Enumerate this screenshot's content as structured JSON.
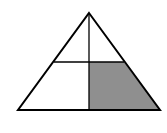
{
  "diagram": {
    "type": "geometric-figure",
    "shape": "triangle",
    "width": 167,
    "height": 133,
    "triangle": {
      "apex": [
        89,
        13
      ],
      "bottom_left": [
        18,
        110
      ],
      "bottom_right": [
        160,
        110
      ]
    },
    "lines": {
      "vertical": {
        "x": 89,
        "y1": 13,
        "y2": 110
      },
      "horizontal": {
        "y": 62,
        "x1": 54,
        "x2": 124
      }
    },
    "regions": [
      {
        "name": "top-left",
        "shaded": false
      },
      {
        "name": "top-right",
        "shaded": false
      },
      {
        "name": "bottom-left",
        "shaded": false
      },
      {
        "name": "bottom-right",
        "shaded": true
      }
    ],
    "colors": {
      "stroke": "#000000",
      "shade": "#8f8f8f",
      "background": "#ffffff"
    }
  }
}
